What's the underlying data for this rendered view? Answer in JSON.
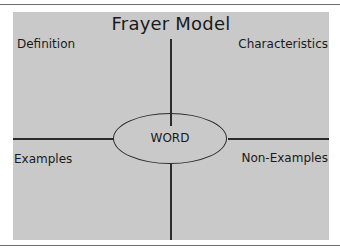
{
  "diagram": {
    "title": "Frayer Model",
    "center_word": "WORD",
    "quadrants": {
      "top_left": "Definition",
      "top_right": "Characteristics",
      "bottom_left": "Examples",
      "bottom_right": "Non-Examples"
    }
  },
  "colors": {
    "panel_background": "#c9c9c9",
    "line": "#2b2b2b",
    "text": "#1a1a1a",
    "rule": "#6f6f6f"
  }
}
